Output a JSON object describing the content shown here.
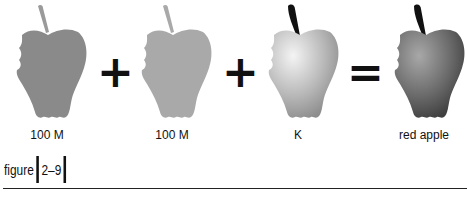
{
  "equation": {
    "operands": [
      {
        "label": "100 M",
        "fill": "#8a8a8a",
        "stem": "#9a9a9a",
        "style": "flat"
      },
      {
        "label": "100 M",
        "fill": "#a9a9a9",
        "stem": "#a9a9a9",
        "style": "flat"
      },
      {
        "label": "K",
        "fill": "#bdbdbd",
        "stem": "#111111",
        "style": "gradient-light"
      },
      {
        "label": "red apple",
        "fill": "#6e6e6e",
        "stem": "#111111",
        "style": "gradient-dark"
      }
    ],
    "operators": [
      "+",
      "+",
      "="
    ]
  },
  "caption": {
    "prefix": "figure",
    "number": "2–9"
  }
}
